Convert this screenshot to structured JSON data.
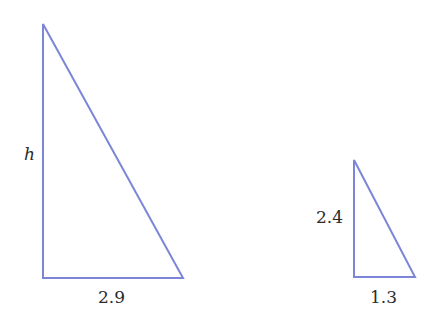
{
  "diagram": {
    "stroke_color": "#7b86d9",
    "triangles": [
      {
        "id": "large",
        "vertices": {
          "top": [
            43,
            24
          ],
          "bottom_left": [
            43,
            278
          ],
          "bottom_right": [
            183,
            278
          ]
        },
        "labels": {
          "height": "h",
          "base": "2.9"
        }
      },
      {
        "id": "small",
        "vertices": {
          "top": [
            354,
            160
          ],
          "bottom_left": [
            354,
            277
          ],
          "bottom_right": [
            415,
            277
          ]
        },
        "labels": {
          "height": "2.4",
          "base": "1.3"
        }
      }
    ]
  }
}
